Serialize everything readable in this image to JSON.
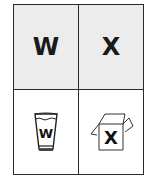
{
  "grid": {
    "cells": [
      {
        "position": "top-left",
        "type": "letter",
        "label": "W"
      },
      {
        "position": "top-right",
        "type": "letter",
        "label": "X"
      },
      {
        "position": "bottom-left",
        "type": "picture",
        "icon": "cup-icon",
        "label": "W"
      },
      {
        "position": "bottom-right",
        "type": "picture",
        "icon": "box-icon",
        "label": "X"
      }
    ]
  },
  "colors": {
    "top_fill": "#ececec",
    "border": "#2a2a2a",
    "text": "#1a1a1a"
  }
}
